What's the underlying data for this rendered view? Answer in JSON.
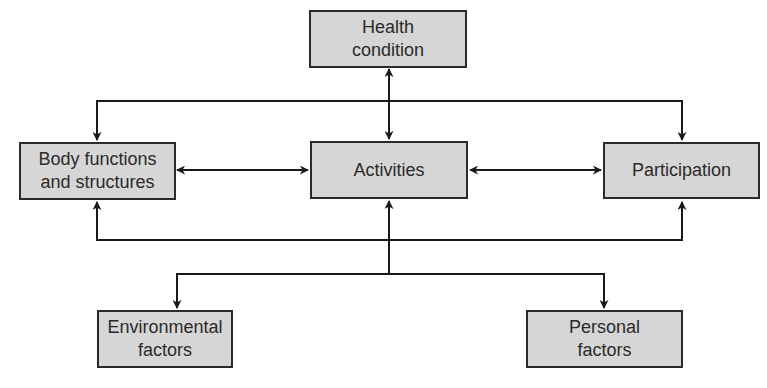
{
  "diagram": {
    "type": "flowchart",
    "colors": {
      "box_fill": "#d6d6d6",
      "stroke": "#2a2a2a",
      "background": "#ffffff"
    },
    "nodes": {
      "health": {
        "label": "Health\ncondition"
      },
      "body": {
        "label": "Body functions\nand structures"
      },
      "activities": {
        "label": "Activities"
      },
      "participation": {
        "label": "Participation"
      },
      "environmental": {
        "label": "Environmental\nfactors"
      },
      "personal": {
        "label": "Personal\nfactors"
      }
    },
    "edges": [
      {
        "from": "health",
        "to": "activities",
        "direction": "bidirectional"
      },
      {
        "from": "health",
        "to": "body",
        "direction": "forward"
      },
      {
        "from": "health",
        "to": "participation",
        "direction": "forward"
      },
      {
        "from": "body",
        "to": "activities",
        "direction": "bidirectional"
      },
      {
        "from": "activities",
        "to": "participation",
        "direction": "bidirectional"
      },
      {
        "from": "activities",
        "to": "body",
        "direction": "forward"
      },
      {
        "from": "activities",
        "to": "participation",
        "direction": "forward",
        "note": "lower loop"
      },
      {
        "from": "activities",
        "to": "environmental",
        "direction": "forward"
      },
      {
        "from": "activities",
        "to": "personal",
        "direction": "forward"
      }
    ]
  }
}
